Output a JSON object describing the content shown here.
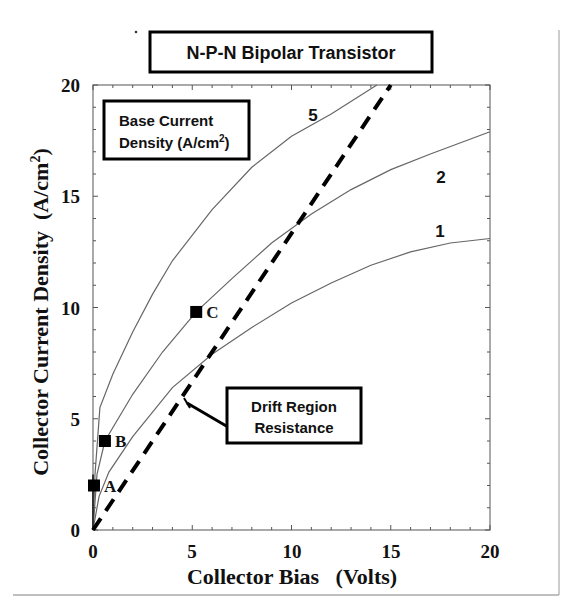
{
  "chart_data": {
    "type": "line",
    "title": "N-P-N Bipolar Transistor",
    "xlabel": "Collector Bias   (Volts)",
    "ylabel": "Collector Current Density  (A/cm²)",
    "xlim": [
      0,
      20
    ],
    "ylim": [
      0,
      20
    ],
    "xticks": [
      0,
      5,
      10,
      15,
      20
    ],
    "yticks": [
      0,
      5,
      10,
      15,
      20
    ],
    "grid": false,
    "legend": {
      "title_line1": "Base Current",
      "title_line2": "Density (A/cm",
      "title_sup": "2",
      "title_end": ")",
      "position": "upper-left"
    },
    "series": [
      {
        "name": "1",
        "label_pos": [
          17.8,
          16.0
        ],
        "x": [
          0,
          0.3,
          0.8,
          2,
          4,
          6,
          8,
          10,
          12,
          14,
          16,
          18,
          20
        ],
        "y": [
          0,
          1.5,
          2.6,
          4.2,
          6.4,
          7.9,
          9.1,
          10.2,
          11.1,
          11.9,
          12.5,
          12.9,
          13.1
        ]
      },
      {
        "name": "2",
        "label_pos": [
          17.8,
          16.2
        ],
        "x": [
          0,
          0.2,
          0.6,
          2,
          3.5,
          5.2,
          7,
          9,
          11,
          13,
          15,
          17,
          20
        ],
        "y": [
          0,
          2.5,
          4.0,
          6.1,
          8.0,
          9.8,
          11.3,
          12.9,
          14.2,
          15.3,
          16.2,
          16.9,
          17.9
        ]
      },
      {
        "name": "5",
        "label_pos": [
          9.8,
          18.5
        ],
        "x": [
          0,
          0.1,
          0.35,
          1,
          2,
          3,
          4,
          6,
          8,
          10,
          12,
          14.3
        ],
        "y": [
          0,
          2.5,
          5.5,
          7.0,
          8.9,
          10.6,
          12.1,
          14.4,
          16.3,
          17.7,
          18.7,
          20
        ]
      }
    ],
    "drift_line": {
      "style": "dashed",
      "x": [
        0,
        15
      ],
      "y": [
        0,
        20
      ]
    },
    "points": [
      {
        "label": "A",
        "x": 0.05,
        "y": 2.0
      },
      {
        "label": "B",
        "x": 0.6,
        "y": 4.0
      },
      {
        "label": "C",
        "x": 5.2,
        "y": 9.8
      }
    ],
    "annotations": [
      {
        "text_line1": "Drift Region",
        "text_line2": "Resistance",
        "arrow_to": [
          4.5,
          5.8
        ]
      }
    ]
  }
}
